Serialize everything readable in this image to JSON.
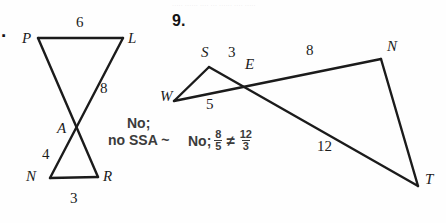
{
  "page": {
    "width": 446,
    "height": 223,
    "background_color": "#fefefe",
    "ink_color": "#1b1b1b",
    "answer_color": "#3b3b3b",
    "ghost_text": "····· ······ ···· ··· ······ ···· ·····"
  },
  "problem_8": {
    "item_number": ".",
    "vertices": [
      {
        "name": "P",
        "label": "P",
        "x": 38,
        "y": 38,
        "label_x": 22,
        "label_y": 30
      },
      {
        "name": "L",
        "label": "L",
        "x": 123,
        "y": 38,
        "label_x": 128,
        "label_y": 30
      },
      {
        "name": "A",
        "label": "A",
        "x": 78,
        "y": 128,
        "label_x": 57,
        "label_y": 120
      },
      {
        "name": "N",
        "label": "N",
        "x": 50,
        "y": 178,
        "label_x": 26,
        "label_y": 168
      },
      {
        "name": "R",
        "label": "R",
        "x": 98,
        "y": 177,
        "label_x": 103,
        "label_y": 168
      }
    ],
    "segments": [
      {
        "name": "segment-PL",
        "from": "P",
        "to": "L"
      },
      {
        "name": "segment-PR",
        "from": "P",
        "to": "R"
      },
      {
        "name": "segment-LN",
        "from": "L",
        "to": "N"
      },
      {
        "name": "segment-NR",
        "from": "N",
        "to": "R"
      }
    ],
    "measures": [
      {
        "name": "measure-PL",
        "value": "6",
        "x": 76,
        "y": 14
      },
      {
        "name": "measure-LA",
        "value": "8",
        "x": 100,
        "y": 80
      },
      {
        "name": "measure-AN",
        "value": "4",
        "x": 42,
        "y": 146
      },
      {
        "name": "measure-NR",
        "value": "3",
        "x": 70,
        "y": 190
      }
    ],
    "answer_line_1": "No;",
    "answer_line_2": "no SSA ~"
  },
  "problem_9": {
    "item_number": "9.",
    "vertices": [
      {
        "name": "S",
        "label": "S",
        "x": 209,
        "y": 67,
        "label_x": 201,
        "label_y": 44
      },
      {
        "name": "E",
        "label": "E",
        "x": 246,
        "y": 86,
        "label_x": 245,
        "label_y": 56
      },
      {
        "name": "N",
        "label": "N",
        "x": 381,
        "y": 59,
        "label_x": 387,
        "label_y": 38
      },
      {
        "name": "W",
        "label": "W",
        "x": 174,
        "y": 101,
        "label_x": 160,
        "label_y": 88
      },
      {
        "name": "T",
        "label": "T",
        "x": 418,
        "y": 186,
        "label_x": 425,
        "label_y": 171
      }
    ],
    "segments": [
      {
        "name": "segment-WS",
        "from": "W",
        "to": "S"
      },
      {
        "name": "segment-ST",
        "from": "S",
        "to": "T"
      },
      {
        "name": "segment-WN",
        "from": "W",
        "to": "N"
      },
      {
        "name": "segment-NT",
        "from": "N",
        "to": "T"
      }
    ],
    "measures": [
      {
        "name": "measure-SE",
        "value": "3",
        "x": 228,
        "y": 44
      },
      {
        "name": "measure-EN",
        "value": "8",
        "x": 306,
        "y": 42
      },
      {
        "name": "measure-WE",
        "value": "5",
        "x": 206,
        "y": 96
      },
      {
        "name": "measure-ET",
        "value": "12",
        "x": 317,
        "y": 138
      }
    ],
    "answer_prefix": "No;",
    "ratio_left": {
      "numerator": "8",
      "denominator": "5"
    },
    "relation_symbol": "≠",
    "ratio_right": {
      "numerator": "12",
      "denominator": "3"
    }
  }
}
